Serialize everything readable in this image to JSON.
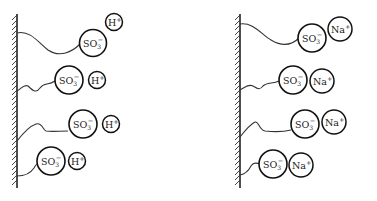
{
  "diagram": {
    "type": "ion-exchange-surface",
    "panels": [
      {
        "id": "acid-form",
        "anion_label": "SO",
        "anion_sub": "3",
        "anion_sup": "−",
        "counter_ion_label": "H",
        "counter_ion_sup": "+",
        "groups": 4
      },
      {
        "id": "sodium-form",
        "anion_label": "SO",
        "anion_sub": "3",
        "anion_sup": "−",
        "counter_ion_label": "Na",
        "counter_ion_sup": "+",
        "groups": 4
      }
    ]
  },
  "colors": {
    "line": "#111111",
    "background": "#ffffff"
  }
}
